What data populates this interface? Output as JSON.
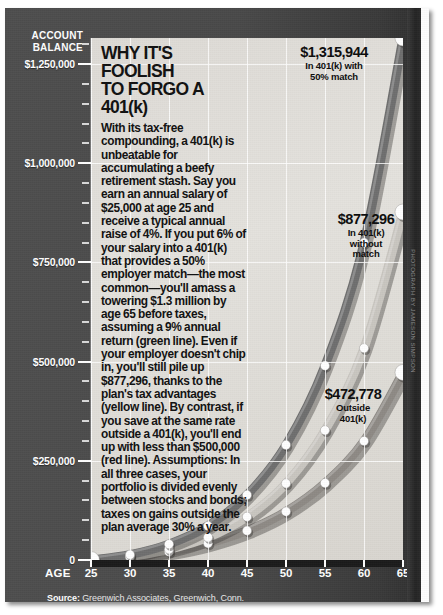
{
  "header": {
    "axis_title": "ACCOUNT BALANCE",
    "headline_line1": "WHY IT'S FOOLISH",
    "headline_line2": "TO FORGO A 401(k)"
  },
  "body_text": "With its tax-free compounding, a 401(k) is unbeatable for accumulating a beefy retirement stash. Say you earn an annual salary of $25,000 at age 25 and receive a typical annual raise of 4%. If you put 6% of your salary into a 401(k) that provides a 50% employer match—the most common—you'll amass a towering $1.3 million by age 65 before taxes, assuming a 9% annual return (green line). Even if your employer doesn't chip in, you'll still pile up $877,296, thanks to the plan's tax advantages (yellow line). By contrast, if you save at the same rate outside a 401(k), you'll end up with less than $500,000 (red line). Assumptions: In all three cases, your portfolio is divided evenly between stocks and bonds; taxes on gains outside the plan average 30% a year.",
  "callouts": [
    {
      "amount": "$1,315,944",
      "label_line1": "In 401(k) with",
      "label_line2": "50% match"
    },
    {
      "amount": "$877,296",
      "label_line1": "In 401(k)",
      "label_line2": "without",
      "label_line3": "match"
    },
    {
      "amount": "$472,778",
      "label_line1": "Outside",
      "label_line2": "401(k)"
    }
  ],
  "source": {
    "label": "Source:",
    "text": "Greenwich Associates, Greenwich, Conn."
  },
  "credit": "PHOTOGRAPH BY JAMESON SIMPSON",
  "axis": {
    "x_prefix": "AGE",
    "y_ticks": [
      "$1,250,000",
      "$1,000,000",
      "$750,000",
      "$500,000",
      "$250,000",
      "0"
    ],
    "x_ticks": [
      "25",
      "30",
      "35",
      "40",
      "45",
      "50",
      "55",
      "60",
      "65"
    ]
  },
  "colors": {
    "panel_bg": "#dedbd6",
    "frame_bg": "#4a4a4a",
    "series_match": "#6f6f6f",
    "series_nomatch": "#c9c6c0",
    "series_outside": "#8e8a85",
    "marker": "#ffffff",
    "axis_text": "#ffffff"
  },
  "chart_data": {
    "type": "line",
    "title": "WHY IT'S FOOLISH TO FORGO A 401(k)",
    "xlabel": "AGE",
    "ylabel": "ACCOUNT BALANCE",
    "x": [
      25,
      30,
      35,
      40,
      45,
      50,
      55,
      60,
      65
    ],
    "xlim": [
      25,
      65
    ],
    "ylim": [
      0,
      1315944
    ],
    "grid": true,
    "legend_position": "annotations-at-line-end",
    "series": [
      {
        "name": "In 401(k) with 50% match",
        "color": "#6f6f6f",
        "end_value": 1315944,
        "values": [
          0,
          13500,
          40000,
          86000,
          164000,
          290000,
          490000,
          800000,
          1315944
        ]
      },
      {
        "name": "In 401(k) without match",
        "color": "#c9c6c0",
        "end_value": 877296,
        "values": [
          0,
          9000,
          27000,
          57000,
          109000,
          193000,
          327000,
          534000,
          877296
        ]
      },
      {
        "name": "Outside 401(k)",
        "color": "#8e8a85",
        "end_value": 472778,
        "values": [
          0,
          7600,
          21000,
          42000,
          74000,
          122000,
          194000,
          300000,
          472778
        ]
      }
    ],
    "annotations": [
      {
        "text": "$1,315,944 In 401(k) with 50% match",
        "x": 65,
        "y": 1315944
      },
      {
        "text": "$877,296 In 401(k) without match",
        "x": 65,
        "y": 877296
      },
      {
        "text": "$472,778 Outside 401(k)",
        "x": 65,
        "y": 472778
      }
    ]
  }
}
